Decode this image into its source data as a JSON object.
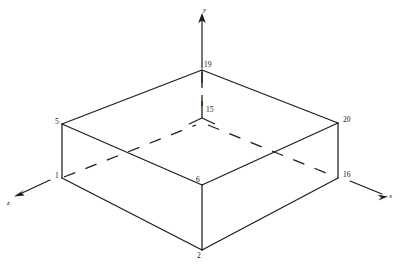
{
  "diagram": {
    "type": "isometric-wireframe-block",
    "canvas": {
      "width": 400,
      "height": 264
    },
    "stroke_color": "#1c1c1c",
    "background_color": "#ffffff",
    "axes": [
      {
        "id": "y-axis",
        "label": "y",
        "label_x": 203,
        "label_y": 7,
        "direction": "up"
      },
      {
        "id": "x-axis",
        "label": "x",
        "label_x": 389,
        "label_y": 193,
        "direction": "down-right"
      },
      {
        "id": "z-axis",
        "label": "z",
        "label_x": 7,
        "label_y": 200,
        "direction": "down-left"
      }
    ],
    "nodes": [
      {
        "id": "19",
        "label": "19",
        "x": 202,
        "y": 70,
        "label_x": 204,
        "label_y": 61,
        "kind": "top-back-apex"
      },
      {
        "id": "15",
        "label": "15",
        "x": 202,
        "y": 113,
        "label_x": 206,
        "label_y": 106,
        "kind": "hidden-interior"
      },
      {
        "id": "5",
        "label": "5",
        "x": 62,
        "y": 124,
        "label_x": 55,
        "label_y": 118,
        "kind": "top-left"
      },
      {
        "id": "20",
        "label": "20",
        "x": 338,
        "y": 123,
        "label_x": 343,
        "label_y": 116,
        "kind": "top-right"
      },
      {
        "id": "1",
        "label": "1",
        "x": 62,
        "y": 178,
        "label_x": 55,
        "label_y": 172,
        "kind": "mid-left"
      },
      {
        "id": "16",
        "label": "16",
        "x": 338,
        "y": 178,
        "label_x": 343,
        "label_y": 171,
        "kind": "mid-right"
      },
      {
        "id": "6",
        "label": "6",
        "x": 202,
        "y": 185,
        "label_x": 196,
        "label_y": 176,
        "kind": "mid-front"
      },
      {
        "id": "2",
        "label": "2",
        "x": 202,
        "y": 250,
        "label_x": 197,
        "label_y": 252,
        "kind": "bottom-front"
      }
    ],
    "edges": [
      {
        "from": "5",
        "to": "19",
        "style": "solid"
      },
      {
        "from": "19",
        "to": "20",
        "style": "solid"
      },
      {
        "from": "5",
        "to": "6",
        "style": "solid"
      },
      {
        "from": "6",
        "to": "20",
        "style": "solid"
      },
      {
        "from": "5",
        "to": "1",
        "style": "solid"
      },
      {
        "from": "20",
        "to": "16",
        "style": "solid"
      },
      {
        "from": "6",
        "to": "2",
        "style": "solid"
      },
      {
        "from": "1",
        "to": "2",
        "style": "solid"
      },
      {
        "from": "2",
        "to": "16",
        "style": "solid"
      },
      {
        "from": "1",
        "to": "15",
        "style": "hidden"
      },
      {
        "from": "15",
        "to": "16",
        "style": "hidden"
      },
      {
        "from": "19",
        "to": "15",
        "style": "hidden"
      }
    ]
  }
}
